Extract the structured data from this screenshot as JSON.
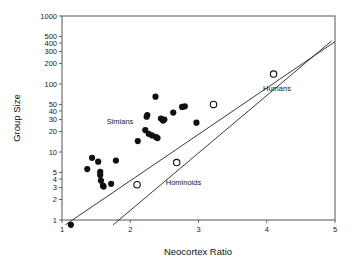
{
  "chart_data": {
    "type": "scatter",
    "title": "",
    "xlabel": "Neocortex Ratio",
    "ylabel": "Group Size",
    "xscale": "linear",
    "yscale": "log",
    "xlim": [
      1,
      5
    ],
    "ylim": [
      1,
      1000
    ],
    "grid": false,
    "legend": "none",
    "xticks": [
      1,
      2,
      3,
      4,
      5
    ],
    "xtick_labels": [
      "1",
      "2",
      "3",
      "4",
      "5"
    ],
    "yticks": [
      1,
      2,
      3,
      4,
      5,
      10,
      20,
      30,
      40,
      50,
      100,
      200,
      300,
      400,
      500,
      1000
    ],
    "ytick_labels": [
      "1",
      "2",
      "3",
      "4",
      "5",
      "10",
      "20",
      "30",
      "40",
      "50",
      "100",
      "200",
      "300",
      "400",
      "500",
      "1000"
    ],
    "annotations": [
      {
        "text": "Simians",
        "x": 1.85,
        "y": 26
      },
      {
        "text": "Hominoids",
        "x": 2.78,
        "y": 3.3
      },
      {
        "text": "Humans",
        "x": 4.15,
        "y": 78
      }
    ],
    "series": [
      {
        "name": "Simians",
        "marker": "filled-circle",
        "color": "#111111",
        "points": [
          {
            "x": 1.13,
            "y": 0.85
          },
          {
            "x": 1.37,
            "y": 5.6
          },
          {
            "x": 1.44,
            "y": 8.2
          },
          {
            "x": 1.53,
            "y": 7.2
          },
          {
            "x": 1.56,
            "y": 5.1
          },
          {
            "x": 1.56,
            "y": 4.6
          },
          {
            "x": 1.57,
            "y": 3.8
          },
          {
            "x": 1.6,
            "y": 3.2
          },
          {
            "x": 1.61,
            "y": 3.1
          },
          {
            "x": 1.72,
            "y": 3.4
          },
          {
            "x": 1.79,
            "y": 7.5
          },
          {
            "x": 2.11,
            "y": 14.5
          },
          {
            "x": 2.22,
            "y": 21.0
          },
          {
            "x": 2.24,
            "y": 33.0
          },
          {
            "x": 2.25,
            "y": 35.0
          },
          {
            "x": 2.27,
            "y": 18.5
          },
          {
            "x": 2.32,
            "y": 17.5
          },
          {
            "x": 2.37,
            "y": 65.0
          },
          {
            "x": 2.38,
            "y": 16.5
          },
          {
            "x": 2.4,
            "y": 16.0
          },
          {
            "x": 2.45,
            "y": 31.0
          },
          {
            "x": 2.48,
            "y": 29.0
          },
          {
            "x": 2.5,
            "y": 30.0
          },
          {
            "x": 2.63,
            "y": 38.0
          },
          {
            "x": 2.76,
            "y": 46.0
          },
          {
            "x": 2.8,
            "y": 47.0
          },
          {
            "x": 2.97,
            "y": 27.0
          }
        ]
      },
      {
        "name": "Hominoids",
        "marker": "open-circle",
        "color": "#111111",
        "points": [
          {
            "x": 2.1,
            "y": 3.3
          },
          {
            "x": 2.68,
            "y": 7.0
          },
          {
            "x": 3.22,
            "y": 50.0
          }
        ]
      },
      {
        "name": "Humans",
        "marker": "open-circle",
        "color": "#111111",
        "points": [
          {
            "x": 4.1,
            "y": 140.0
          }
        ]
      }
    ],
    "fit_lines": [
      {
        "name": "simian-regression",
        "x1": 1.05,
        "y1": 0.85,
        "x2": 5.0,
        "y2": 420
      },
      {
        "name": "hominoid-regression",
        "x1": 1.75,
        "y1": 0.85,
        "x2": 4.95,
        "y2": 430
      }
    ]
  }
}
